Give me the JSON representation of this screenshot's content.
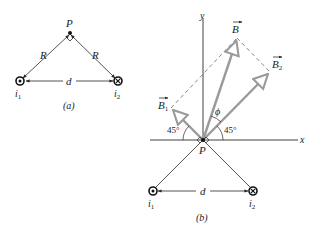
{
  "figure_a": {
    "point_label": "P",
    "side_left_label": "R",
    "side_right_label": "R",
    "distance_label": "d",
    "wire1_label": "i",
    "wire1_sub": "1",
    "wire2_label": "i",
    "wire2_sub": "2",
    "caption": "(a)"
  },
  "figure_b": {
    "y_axis_label": "y",
    "x_axis_label": "x",
    "point_label": "P",
    "vector_B_label": "B",
    "vector_B1_label": "B",
    "vector_B1_sub": "1",
    "vector_B2_label": "B",
    "vector_B2_sub": "2",
    "angle_phi_label": "ϕ",
    "angle_left_label": "45°",
    "angle_right_label": "45°",
    "distance_label": "d",
    "wire1_label": "i",
    "wire1_sub": "1",
    "wire2_label": "i",
    "wire2_sub": "2",
    "caption": "(b)"
  },
  "colors": {
    "line": "#2a2a2a",
    "vector": "#9a9a9a",
    "dashed": "#555555"
  }
}
